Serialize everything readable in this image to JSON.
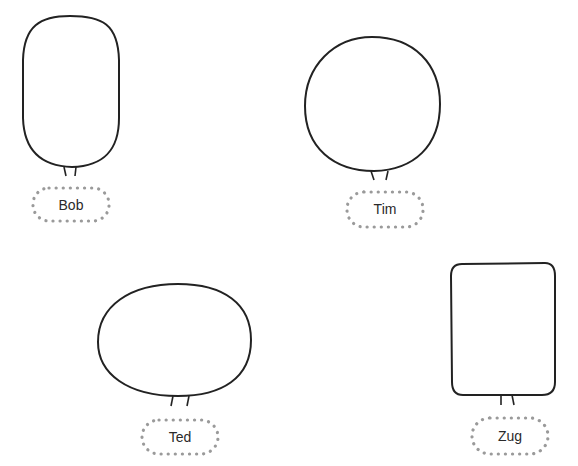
{
  "characters": [
    {
      "name": "Bob",
      "shape": "tall-oval"
    },
    {
      "name": "Tim",
      "shape": "circle"
    },
    {
      "name": "Ted",
      "shape": "wide-oval"
    },
    {
      "name": "Zug",
      "shape": "rounded-rectangle"
    }
  ],
  "colors": {
    "outline": "#222222",
    "label_border": "#9a9a9a",
    "background": "#ffffff"
  }
}
